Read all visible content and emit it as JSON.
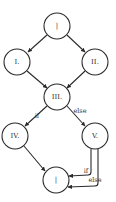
{
  "diagram": {
    "type": "control-flow-graph",
    "nodes": [
      {
        "id": "entry",
        "label": "|"
      },
      {
        "id": "n1",
        "label": "I."
      },
      {
        "id": "n2",
        "label": "II."
      },
      {
        "id": "n3",
        "label": "III."
      },
      {
        "id": "n4",
        "label": "IV."
      },
      {
        "id": "n5",
        "label": "V."
      },
      {
        "id": "exit",
        "label": "|"
      }
    ],
    "edges": [
      {
        "from": "entry",
        "to": "n1",
        "label": ""
      },
      {
        "from": "entry",
        "to": "n2",
        "label": ""
      },
      {
        "from": "n1",
        "to": "n3",
        "label": ""
      },
      {
        "from": "n2",
        "to": "n3",
        "label": ""
      },
      {
        "from": "n3",
        "to": "n4",
        "label": "if"
      },
      {
        "from": "n3",
        "to": "n5",
        "label": "else"
      },
      {
        "from": "n4",
        "to": "exit",
        "label": ""
      },
      {
        "from": "n5",
        "to": "exit",
        "label": "if"
      },
      {
        "from": "n5",
        "to": "exit",
        "label": "else"
      }
    ]
  }
}
